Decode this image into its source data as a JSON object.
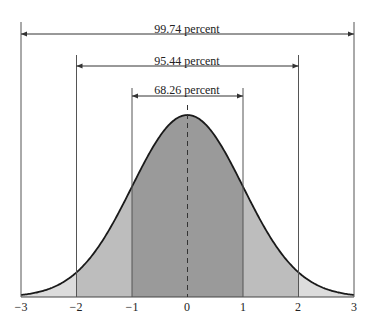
{
  "chart_data": {
    "type": "area",
    "xlabel": "",
    "ylabel": "",
    "x_ticks": [
      "−3",
      "−2",
      "−1",
      "0",
      "1",
      "2",
      "3"
    ],
    "xlim": [
      -3,
      3
    ],
    "grid": false,
    "regions": [
      {
        "range": [
          -1,
          1
        ],
        "label": "68.26 percent",
        "value": 68.26,
        "color": "#9a9a9a"
      },
      {
        "range": [
          -2,
          2
        ],
        "label": "95.44 percent",
        "value": 95.44,
        "color": "#bdbdbd"
      },
      {
        "range": [
          -3,
          3
        ],
        "label": "99.74 percent",
        "value": 99.74,
        "color": "#dcdcdc"
      }
    ],
    "annotations": [
      "dashed vertical line at mean (0)"
    ]
  },
  "labels": {
    "p3": "99.74 percent",
    "p2": "95.44 percent",
    "p1": "68.26 percent",
    "ticks": [
      "−3",
      "−2",
      "−1",
      "0",
      "1",
      "2",
      "3"
    ]
  }
}
